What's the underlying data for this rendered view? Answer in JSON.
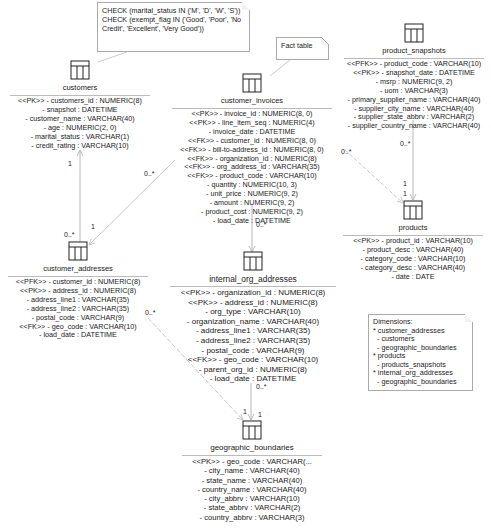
{
  "notes": {
    "check_constraints": {
      "lines": [
        "CHECK (marital_status IN ('M', 'D', 'W', 'S'))",
        "CHECK (exempt_flag IN ('Good', 'Poor', 'No",
        "Credit', 'Excellent', 'Very Good'))"
      ]
    },
    "fact_table": {
      "text": "Fact table"
    },
    "dimensions": {
      "lines": [
        "Dimensions:",
        "* customer_addresses",
        "  - customers",
        "  - geographic_boundaries",
        "* products",
        "  - products_snapshots",
        "* internal_org_addresses",
        "  - geographic_boundaries"
      ]
    }
  },
  "entities": {
    "customers": {
      "name": "customers",
      "attributes": [
        "<<PK>> - customers_id : NUMERIC(8)",
        "- snapshot : DATETIME",
        "- customer_name : VARCHAR(40)",
        "- age : NUMERIC(2, 0)",
        "- marital_status : VARCHAR(1)",
        "- credit_rating : VARCHAR(10)"
      ]
    },
    "customer_invoices": {
      "name": "customer_invoices",
      "attributes": [
        "<<PK>> - invoice_id : NUMERIC(8, 0)",
        "<<PK>> - line_item_seq : NUMERIC(4)",
        "- invoice_date : DATETIME",
        "<<FK>> - customer_id : NUMERIC(8, 0)",
        "<<FK>> - bill-to-address_id : NUMERIC(8, 0)",
        "<<FK>> - organization_id : NUMERIC(8)",
        "<<FK>> - org_address_id : VARCHAR(35)",
        "<<FK>> - product_code : VARCHAR(10)",
        "- quantity : NUMERIC(10, 3)",
        "- unit_price : NUMERIC(9, 2)",
        "- amount : NUMERIC(9, 2)",
        "- product_cost : NUMERIC(9, 2)",
        "- load_date : DATETIME"
      ]
    },
    "product_snapshots": {
      "name": "product_snapshots",
      "attributes": [
        "<<PFK>> - product_code : VARCHAR(10)",
        "<<PK>> - snapshot_date : DATETIME",
        "- msrp : NUMERIC(9, 2)",
        "- uom : VARCHAR(3)",
        "- primary_supplier_name : VARCHAR(40)",
        "- supplier_city_name : VARCHAR(40)",
        "- supplier_state_abbrv : VARCHAR(2)",
        "- supplier_country_name : VARCHAR(40)"
      ]
    },
    "products": {
      "name": "products",
      "attributes": [
        "<<PK>> - product_id : VARCHAR(10)",
        "- product_desc : VARCHAR(40)",
        "- category_code : VARCHAR(10)",
        "- category_desc : VARCHAR(40)",
        "- date : DATE"
      ]
    },
    "customer_addresses": {
      "name": "customer_addresses",
      "attributes": [
        "<<PFK>> - customer_id : NUMERIC(8)",
        "<<PK>> - address_id : NUMERIC(8)",
        "- address_line1 : VARCHAR(35)",
        "- address_line2 : VARCHAR(35)",
        "- postal_code : VARCHAR(9)",
        "<<FK>> - geo_code : VARCHAR(10)",
        "- load_date : DATETIME"
      ]
    },
    "internal_org_addresses": {
      "name": "internal_org_addresses",
      "attributes": [
        "<<PK>> - organization_id : NUMERIC(8)",
        "<<PK>> - address_id : NUMERIC(8)",
        "- org_type : VARCHAR(10)",
        "- organization_name : VARCHAR(40)",
        "- address_line1 : VARCHAR(35)",
        "- address_line2 : VARCHAR(35)",
        "- postal_code : VARCHAR(9)",
        "<<FK>> - geo_code : VARCHAR(10)",
        "- parent_org_id : NUMERIC(8)",
        "- load_date : DATETIME"
      ]
    },
    "geographic_boundaries": {
      "name": "geographic_boundaries",
      "attributes": [
        "<<PK>> - geo_code : VARCHAR(...",
        "- city_name : VARCHAR(40)",
        "- state_name : VARCHAR(40)",
        "- country_name : VARCHAR(40)",
        "- city_abbrv : VARCHAR(10)",
        "- state_abbrv : VARCHAR(2)",
        "- country_abbrv : VARCHAR(3)"
      ]
    }
  },
  "multiplicities": {
    "cust_to_addr_top": "1",
    "cust_to_addr_bottom": "0..*",
    "inv_to_addr_top": "0..*",
    "inv_to_addr_bottom": "1",
    "inv_to_org": "0..*",
    "inv_to_products_top": "0..*",
    "snap_to_products_top": "0..*",
    "products_one_a": "1",
    "products_one_b": "1",
    "addr_to_geo_top": "0..*",
    "org_to_geo_top": "0..*",
    "geo_one_left": "1",
    "geo_one_right": "1"
  },
  "colors": {
    "line": "#b8b8b8",
    "dashed_line": "#c8c8c8",
    "text": "#1a1a1a",
    "icon_stroke": "#222222"
  }
}
